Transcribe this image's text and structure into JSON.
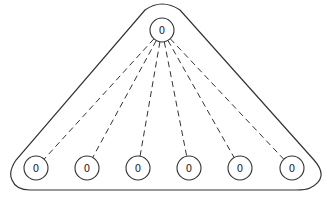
{
  "diagram": {
    "root": {
      "label": "0",
      "cx": 162,
      "cy": 30,
      "r": 12
    },
    "leaves": [
      {
        "label": "0",
        "cx": 36,
        "cy": 168,
        "r": 12
      },
      {
        "label": "0",
        "cx": 87,
        "cy": 168,
        "r": 12
      },
      {
        "label": "0",
        "cx": 138,
        "cy": 168,
        "r": 12
      },
      {
        "label": "0",
        "cx": 189,
        "cy": 168,
        "r": 12
      },
      {
        "label": "0",
        "cx": 240,
        "cy": 168,
        "r": 12
      },
      {
        "label": "0",
        "cx": 292,
        "cy": 168,
        "r": 12
      }
    ],
    "edge_style": "dashed",
    "outline": "rounded-triangle",
    "stroke_color": "#333333"
  }
}
